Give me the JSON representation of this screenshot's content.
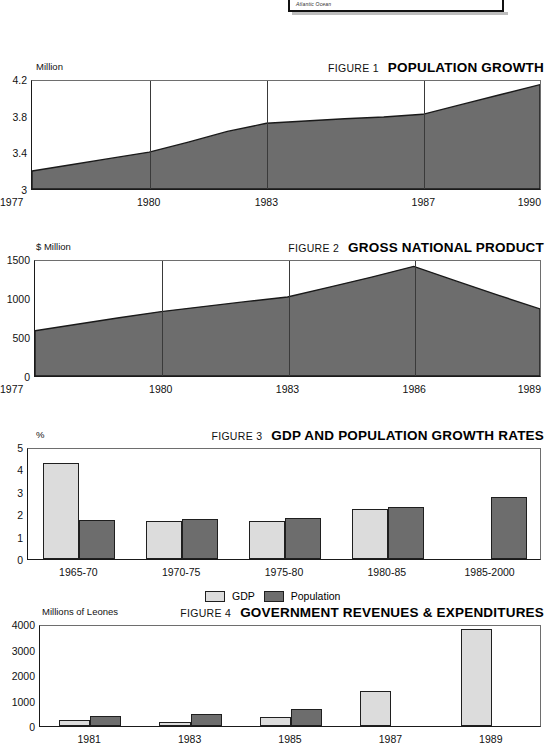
{
  "map_inset": {
    "label": "Atlantic Ocean"
  },
  "figures": [
    {
      "number": "FIGURE 1",
      "title": "POPULATION GROWTH",
      "unit": "Million"
    },
    {
      "number": "FIGURE 2",
      "title": "GROSS NATIONAL PRODUCT",
      "unit": "$ Million"
    },
    {
      "number": "FIGURE 3",
      "title": "GDP AND POPULATION GROWTH RATES",
      "unit": "%"
    },
    {
      "number": "FIGURE 4",
      "title": "GOVERNMENT REVENUES & EXPENDITURES",
      "unit": "Millions of Leones"
    }
  ],
  "colors": {
    "series_light": "#dcdcdc",
    "series_dark": "#6d6d6d",
    "axis": "#1a1a1a",
    "frame": "#6e6e6e"
  },
  "chart_data": [
    {
      "type": "area",
      "title": "POPULATION GROWTH",
      "figure_number": "FIGURE 1",
      "xlabel": "",
      "ylabel": "Million",
      "ylim": [
        3,
        4.2
      ],
      "yticks": [
        "3",
        "3.4",
        "3.8",
        "4.2"
      ],
      "ytick_values": [
        3,
        3.4,
        3.8,
        4.2
      ],
      "xticks": [
        "1977",
        "1980",
        "1983",
        "1987",
        "1990"
      ],
      "xtick_values": [
        1977,
        1980,
        1983,
        1987,
        1990
      ],
      "xlim": [
        1977,
        1990
      ],
      "grid": false,
      "fill_color": "#6d6d6d",
      "x": [
        1977,
        1978,
        1979,
        1980,
        1981,
        1982,
        1983,
        1984,
        1985,
        1986,
        1987,
        1988,
        1989,
        1990
      ],
      "values": [
        3.2,
        3.27,
        3.34,
        3.41,
        3.52,
        3.64,
        3.73,
        3.755,
        3.78,
        3.8,
        3.83,
        3.94,
        4.05,
        4.16
      ]
    },
    {
      "type": "area",
      "title": "GROSS NATIONAL PRODUCT",
      "figure_number": "FIGURE 2",
      "xlabel": "",
      "ylabel": "$ Million",
      "ylim": [
        0,
        1500
      ],
      "yticks": [
        "0",
        "500",
        "1000",
        "1500"
      ],
      "ytick_values": [
        0,
        500,
        1000,
        1500
      ],
      "xticks": [
        "1977",
        "1980",
        "1983",
        "1986",
        "1989"
      ],
      "xtick_values": [
        1977,
        1980,
        1983,
        1986,
        1989
      ],
      "xlim": [
        1977,
        1989
      ],
      "grid": false,
      "fill_color": "#6d6d6d",
      "x": [
        1977,
        1978,
        1979,
        1980,
        1981,
        1982,
        1983,
        1984,
        1985,
        1986,
        1987,
        1988,
        1989
      ],
      "values": [
        590,
        675,
        760,
        840,
        905,
        970,
        1030,
        1160,
        1290,
        1430,
        1240,
        1055,
        875
      ]
    },
    {
      "type": "bar",
      "title": "GDP AND POPULATION GROWTH RATES",
      "figure_number": "FIGURE 3",
      "xlabel": "",
      "ylabel": "%",
      "ylim": [
        0,
        5
      ],
      "yticks": [
        "0",
        "1",
        "2",
        "3",
        "4",
        "5"
      ],
      "ytick_values": [
        0,
        1,
        2,
        3,
        4,
        5
      ],
      "categories": [
        "1965-70",
        "1970-75",
        "1975-80",
        "1980-85",
        "1985-2000"
      ],
      "grid": false,
      "legend_position": "bottom-center",
      "series": [
        {
          "name": "GDP",
          "color": "#dcdcdc",
          "values": [
            4.3,
            1.68,
            1.7,
            2.22,
            null
          ]
        },
        {
          "name": "Population",
          "color": "#6d6d6d",
          "values": [
            1.75,
            1.78,
            1.82,
            2.33,
            2.77
          ]
        }
      ]
    },
    {
      "type": "bar",
      "title": "GOVERNMENT REVENUES & EXPENDITURES",
      "figure_number": "FIGURE 4",
      "xlabel": "",
      "ylabel": "Millions of Leones",
      "ylim": [
        0,
        4000
      ],
      "yticks": [
        "0",
        "1000",
        "2000",
        "3000",
        "4000"
      ],
      "ytick_values": [
        0,
        1000,
        2000,
        3000,
        4000
      ],
      "categories": [
        "1981",
        "1983",
        "1985",
        "1987",
        "1989"
      ],
      "grid": false,
      "series": [
        {
          "name": "Revenues",
          "color": "#dcdcdc",
          "values": [
            225,
            175,
            350,
            1370,
            3820
          ]
        },
        {
          "name": "Expenditures",
          "color": "#6d6d6d",
          "values": [
            390,
            470,
            660,
            null,
            null
          ]
        }
      ]
    }
  ],
  "legend": {
    "entries": [
      {
        "label": "GDP",
        "swatch": "light"
      },
      {
        "label": "Population",
        "swatch": "dark"
      }
    ]
  }
}
